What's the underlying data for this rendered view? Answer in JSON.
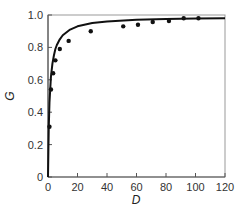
{
  "chart_data": {
    "type": "scatter",
    "title": "",
    "xlabel": "D",
    "ylabel": "G",
    "xlim": [
      0,
      120
    ],
    "ylim": [
      0,
      1.0
    ],
    "grid": false,
    "legend": null,
    "x_ticks": [
      0,
      20,
      40,
      60,
      80,
      100,
      120
    ],
    "x_tick_labels": [
      "0",
      "20",
      "40",
      "60",
      "80",
      "100",
      "120"
    ],
    "y_ticks": [
      0,
      0.2,
      0.4,
      0.6,
      0.8,
      1.0
    ],
    "y_tick_labels": [
      "0",
      "0.2",
      "0.4",
      "0.6",
      "0.8",
      "1.0"
    ],
    "series": [
      {
        "name": "observed",
        "style": "points",
        "x": [
          1,
          2,
          3.5,
          5,
          8,
          14,
          29,
          51,
          61,
          71,
          82,
          92,
          102
        ],
        "y": [
          0.31,
          0.54,
          0.64,
          0.72,
          0.79,
          0.84,
          0.9,
          0.93,
          0.94,
          0.957,
          0.963,
          0.98,
          0.98
        ]
      },
      {
        "name": "fitted curve",
        "style": "line",
        "x": [
          0,
          0.5,
          1,
          2,
          3,
          4,
          5,
          6,
          8,
          10,
          15,
          20,
          30,
          40,
          60,
          80,
          100,
          120
        ],
        "y": [
          0,
          0.3,
          0.46,
          0.62,
          0.7,
          0.75,
          0.79,
          0.815,
          0.85,
          0.875,
          0.91,
          0.93,
          0.95,
          0.96,
          0.97,
          0.975,
          0.978,
          0.98
        ]
      }
    ]
  }
}
